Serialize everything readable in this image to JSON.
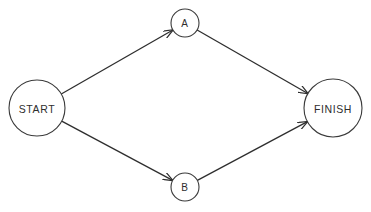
{
  "diagram": {
    "type": "network-flow",
    "nodes": [
      {
        "id": "start",
        "label": "START",
        "cx": 37,
        "cy": 108,
        "r": 28,
        "font_size": 10.5
      },
      {
        "id": "a",
        "label": "A",
        "cx": 185,
        "cy": 23,
        "r": 14,
        "font_size": 10
      },
      {
        "id": "b",
        "label": "B",
        "cx": 185,
        "cy": 187,
        "r": 14,
        "font_size": 10
      },
      {
        "id": "finish",
        "label": "FINISH",
        "cx": 333,
        "cy": 108,
        "r": 29,
        "font_size": 10.5
      }
    ],
    "edges": [
      {
        "from": "start",
        "to": "a",
        "directed": true
      },
      {
        "from": "start",
        "to": "b",
        "directed": true
      },
      {
        "from": "a",
        "to": "finish",
        "directed": true
      },
      {
        "from": "b",
        "to": "finish",
        "directed": true
      }
    ],
    "colors": {
      "background": "#ffffff",
      "stroke": "#3a3a3a",
      "text": "#2e2e2e"
    }
  }
}
